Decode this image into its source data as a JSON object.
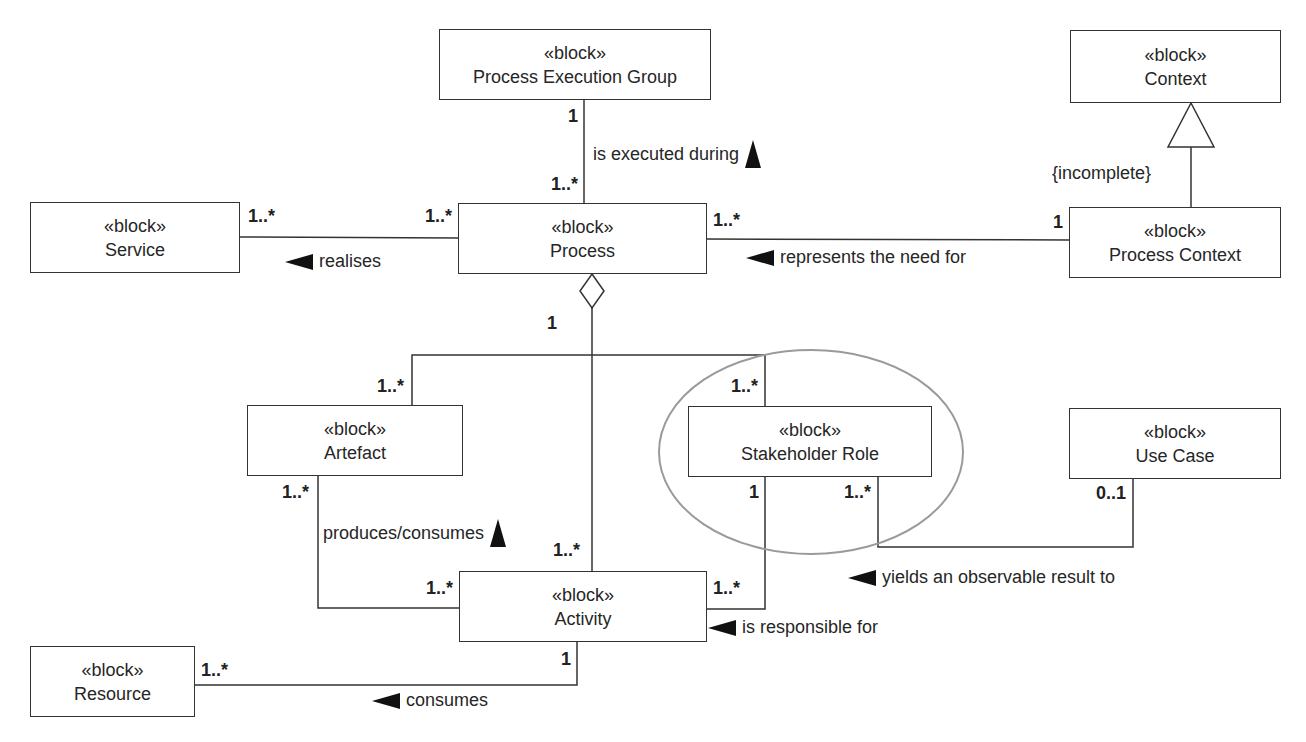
{
  "diagram": {
    "type": "SysML block definition diagram",
    "stereotype": "«block»",
    "blocks": {
      "process_execution_group": {
        "stereotype": "«block»",
        "name": "Process Execution Group"
      },
      "context": {
        "stereotype": "«block»",
        "name": "Context"
      },
      "service": {
        "stereotype": "«block»",
        "name": "Service"
      },
      "process": {
        "stereotype": "«block»",
        "name": "Process"
      },
      "process_context": {
        "stereotype": "«block»",
        "name": "Process Context"
      },
      "artefact": {
        "stereotype": "«block»",
        "name": "Artefact"
      },
      "stakeholder_role": {
        "stereotype": "«block»",
        "name": "Stakeholder Role"
      },
      "use_case": {
        "stereotype": "«block»",
        "name": "Use Case"
      },
      "activity": {
        "stereotype": "«block»",
        "name": "Activity"
      },
      "resource": {
        "stereotype": "«block»",
        "name": "Resource"
      }
    },
    "relationships": {
      "executed_during": {
        "label": "is executed during",
        "direction": "up",
        "source_mult": "1..*",
        "target_mult": "1"
      },
      "realises": {
        "label": "realises",
        "direction": "left",
        "left_mult": "1..*",
        "right_mult": "1..*"
      },
      "represents_need": {
        "label": "represents the need for",
        "direction": "left",
        "left_mult": "1..*",
        "right_mult": "1"
      },
      "generalisation": {
        "constraint": "{incomplete}"
      },
      "aggregation": {
        "whole_mult": "1",
        "artefact_mult": "1..*",
        "stakeholder_mult": "1..*",
        "activity_mult": "1..*"
      },
      "produces_consumes": {
        "label": "produces/consumes",
        "direction": "up",
        "artefact_mult": "1..*",
        "activity_mult": "1..*"
      },
      "responsible_for": {
        "label": "is responsible for",
        "direction": "left",
        "stakeholder_mult": "1",
        "activity_mult": "1..*"
      },
      "yields_result": {
        "label": "yields an observable result to",
        "direction": "left",
        "stakeholder_mult": "1..*",
        "use_case_mult": "0..1"
      },
      "consumes": {
        "label": "consumes",
        "direction": "left",
        "resource_mult": "1..*",
        "activity_mult": "1"
      }
    },
    "highlight": {
      "target": "Stakeholder Role",
      "shape": "ellipse",
      "color": "#9a9a9a"
    }
  }
}
